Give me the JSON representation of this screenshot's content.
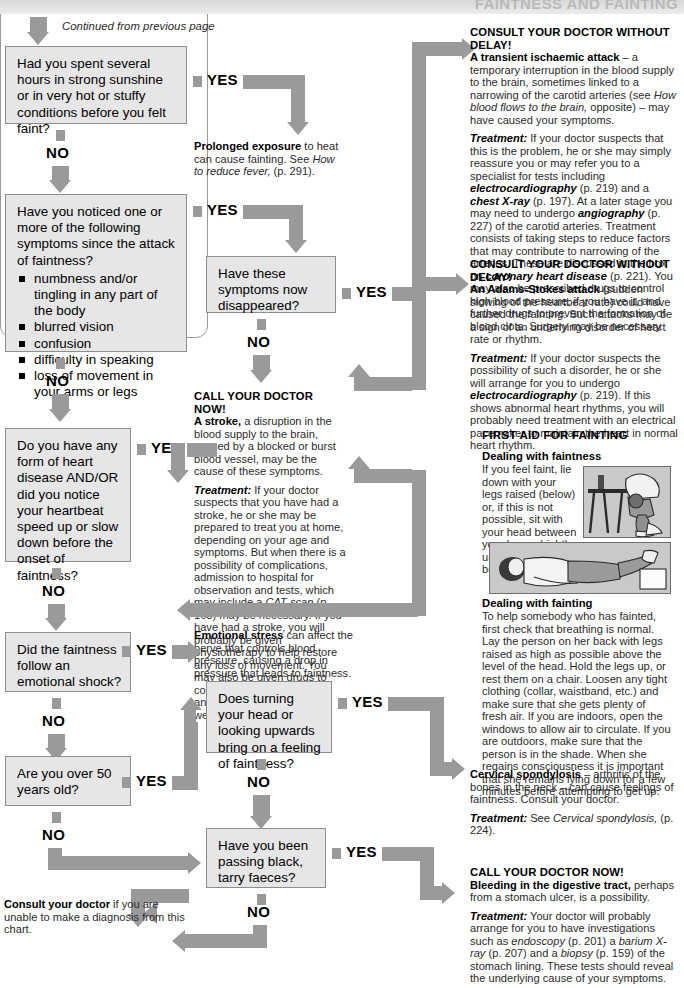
{
  "header": {
    "title": "FAINTNESS AND FAINTING"
  },
  "caption": {
    "continued": "Continued from previous page"
  },
  "labels": {
    "yes": "YES",
    "no": "NO"
  },
  "colors": {
    "arrow": "#9a9a9a",
    "box_fill": "#e6e6e6",
    "box_border": "#8e8e8e",
    "text": "#1a1a1a"
  },
  "questions": [
    {
      "id": "q-sunshine",
      "text": "Had you spent several hours in strong sunshine or in very hot or stuffy conditions before you felt faint?",
      "bullets": []
    },
    {
      "id": "q-symptoms",
      "text": "Have you noticed one or more of the following symptoms since the attack of faintness?",
      "bullets": [
        "numbness and/or tingling in any part of the body",
        "blurred vision",
        "confusion",
        "difficulty in speaking",
        "loss of movement in your arms or legs"
      ]
    },
    {
      "id": "q-disappeared",
      "text": "Have these symptoms now disappeared?",
      "bullets": []
    },
    {
      "id": "q-heart",
      "text": "Do you have any form of heart disease AND/OR did you notice your heartbeat speed up or slow down before the onset of faintness?",
      "bullets": []
    },
    {
      "id": "q-emotional",
      "text": "Did the faintness follow an emotional shock?",
      "bullets": []
    },
    {
      "id": "q-over50",
      "text": "Are you over 50 years old?",
      "bullets": []
    },
    {
      "id": "q-turning-head",
      "text": "Does turning your head or looking upwards bring on a feeling of faintness?",
      "bullets": []
    },
    {
      "id": "q-tarry-faeces",
      "text": "Have you been passing black, tarry faeces?",
      "bullets": []
    }
  ],
  "outcomes": {
    "prolonged_exposure": {
      "lead": "Prolonged exposure",
      "rest": " to heat can cause fainting. See ",
      "ital": "How to reduce fever,",
      "tail": " (p. 291)."
    },
    "transient_ischaemic": {
      "heading": "CONSULT YOUR DOCTOR WITHOUT DELAY!",
      "lead": "A transient ischaemic attack",
      "body": " – a temporary interruption in the blood supply to the brain, sometimes linked to a narrowing of the carotid arteries (see ",
      "body_ital": "How blood flows to the brain,",
      "body_tail": " opposite) – may have caused your symptoms.",
      "treatment_label": "Treatment:",
      "treatment_1": " If your doctor suspects that this is the problem, he or she may simply reassure you or may refer you to a specialist for tests including ",
      "treatment_i1": "electrocardiography",
      "treatment_2": " (p. 219) and a ",
      "treatment_i2": "chest X-ray",
      "treatment_3": " (p. 197). At a later stage you may need to undergo ",
      "treatment_i3": "angiography",
      "treatment_4": " (p. 227) of the carotid arteries. Treatment consists of taking steps to reduce factors that may contribute to narrowing of the arteries. These are discussed in the box on ",
      "treatment_i4": "coronary heart disease",
      "treatment_5": " (p. 221). You may also be prescribed drugs to control high blood pressure, if you have it, and further drugs to prevent the formation of blood clots. Surgery may be necessary."
    },
    "adams_stokes": {
      "heading": "CONSULT YOUR DOCTOR WITHOUT DELAY!",
      "lead": "An Adams-Stokes attack",
      "body": " (sudden slowing of the heartbeat rate) could have caused the fainting. Such attacks may be a sign of an underlying disorder of heart rate or rhythm.",
      "treatment_label": "Treatment:",
      "treatment_1": " If your doctor suspects the possibility of such a disorder, he or she will arrange for you to undergo ",
      "treatment_i1": "electrocardiography",
      "treatment_2": " (p. 219). If this shows abnormal heart rhythms, you will probably need treatment with an electrical pacemaker to maintain the heart in normal heart rhythm."
    },
    "stroke": {
      "heading": "CALL YOUR DOCTOR NOW!",
      "lead": "A stroke,",
      "body": " a disruption in the blood supply to the brain, caused by a blocked or burst blood vessel, may be the cause of these symptoms.",
      "treatment_label": "Treatment:",
      "treatment_1": " If your doctor suspects that you have had a stroke, he or she may be prepared to treat you at home, depending on your age and symptoms. But when there is a possibility of complications, admission to hospital for observation and tests, which may include a ",
      "treatment_i1": "CAT scan",
      "treatment_2": " (p. 163) may be necessary. If you have had a stroke, you will probably be given physiotherapy to help restore any loss of movement. You may also be given drugs to control high blood pressure and may be advised to lose weight."
    },
    "emotional_stress": {
      "lead": "Emotional stress",
      "body": " can affect the nerve that controls blood pressure, causing a drop in pressure that leads to faintness."
    },
    "cervical_spondylosis": {
      "lead": "Cervical spondylosis",
      "body": " – arthritis of the bones in the neck – can cause feelings of faintness. Consult your doctor.",
      "treatment_label": "Treatment:",
      "treatment_1": " See ",
      "treatment_i1": "Cervical spondylosis,",
      "treatment_2": " (p. 224)."
    },
    "digestive_bleeding": {
      "heading": "CALL YOUR DOCTOR NOW!",
      "lead": "Bleeding in the digestive tract,",
      "body": " perhaps from a stomach ulcer, is a possibility.",
      "treatment_label": "Treatment:",
      "treatment_1": " Your doctor will probably arrange for you to have investigations such as ",
      "treatment_i1": "endoscopy",
      "treatment_2": " (p. 201) a ",
      "treatment_i2": "barium X-ray",
      "treatment_3": " (p. 207) and a ",
      "treatment_i3": "biopsy",
      "treatment_4": " (p. 159) of the stomach lining. These tests should reveal the underlying cause of your symptoms."
    },
    "final": {
      "lead": "Consult your doctor",
      "body": " if you are unable to make a diagnosis from this chart."
    }
  },
  "first_aid": {
    "title": "FIRST AID FOR FAINTING",
    "faintness_head": "Dealing with faintness",
    "faintness_body": "If you feel faint, lie down with your legs raised (below) or, if this is not possible, sit with your head between your knees (right) until you feel better.",
    "fainting_head": "Dealing with fainting",
    "fainting_body": "To help somebody who has fainted, first check that breathing is normal. Lay the person on her back with legs raised as high as possible above the level of the head. Hold the legs up, or rest them on a chair. Loosen any tight clothing (collar, waistband, etc.) and make sure that she gets plenty of fresh air. If you are indoors, open the windows to allow air to circulate. If you are outdoors, make sure that the person is in the shade. When she regains consciousness it is important that she remains lying down for a few minutes before attempting to get up."
  }
}
